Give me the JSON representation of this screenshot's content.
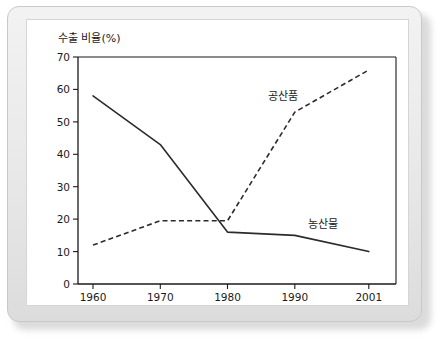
{
  "chart_data": {
    "type": "line",
    "title": "",
    "ylabel": "수출 비율(%)",
    "xlabel": "",
    "x": [
      1960,
      1970,
      1980,
      1990,
      2001
    ],
    "xtick_labels": [
      "1960",
      "1970",
      "1980",
      "1990",
      "2001"
    ],
    "ytick_labels": [
      "0",
      "10",
      "20",
      "30",
      "40",
      "50",
      "60",
      "70"
    ],
    "ytick_values": [
      0,
      10,
      20,
      30,
      40,
      50,
      60,
      70
    ],
    "ylim": [
      0,
      70
    ],
    "grid": false,
    "legend_position": "inline-annotation",
    "series": [
      {
        "name": "농산물",
        "style": "solid",
        "label_text": "농산물",
        "values": [
          58,
          43,
          16,
          15,
          10
        ]
      },
      {
        "name": "공산품",
        "style": "dashed",
        "label_text": "공산품",
        "values": [
          12,
          19.5,
          19.5,
          53,
          66
        ]
      }
    ]
  },
  "axis": {
    "y_title": "수출 비율(%)",
    "y_ticks": [
      "70",
      "60",
      "50",
      "40",
      "30",
      "20",
      "10",
      "0"
    ],
    "x_ticks": [
      "1960",
      "1970",
      "1980",
      "1990",
      "2001"
    ]
  },
  "annotations": {
    "manufactured_label": "공산품",
    "agricultural_label": "농산물"
  },
  "colors": {
    "line": "#2b2b2b",
    "axis": "#1a1a1a",
    "panel_bg": "#ffffff",
    "bezel_bg": "#e9e9e9"
  }
}
